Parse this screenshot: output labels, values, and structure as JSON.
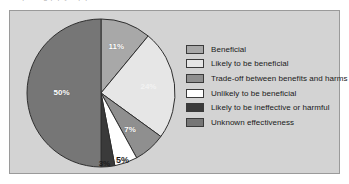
{
  "page": {
    "background": "#ffffff",
    "panel_background": "#d3d3d3",
    "panel_border": "#9a9a9a",
    "top_text_fragment": "a o p  a  o  g  p    p y     a     p      p"
  },
  "chart_data": {
    "type": "pie",
    "title": "",
    "subtitle": "",
    "xlabel": "",
    "ylabel": "",
    "grid": false,
    "legend_position": "right",
    "start_angle_deg": 0,
    "direction": "clockwise",
    "units": "percent",
    "categories": [
      "Beneficial",
      "Likely to be beneficial",
      "Trade-off between benefits and harms",
      "Unlikely to be beneficial",
      "Likely to be ineffective or harmful",
      "Unknown effectiveness"
    ],
    "values": [
      11,
      24,
      7,
      5,
      3,
      50
    ],
    "data_labels": [
      "11%",
      "24%",
      "7%",
      "5%",
      "3%",
      "50%"
    ],
    "colors": [
      "#a8a8a8",
      "#e6e6e6",
      "#8f8f8f",
      "#ffffff",
      "#3a3a3a",
      "#767676"
    ],
    "slice_label_color": [
      "#ffffff",
      "#f2f2f2",
      "#ffffff",
      "#1d1d1d",
      "#1d1d1d",
      "#ffffff"
    ],
    "slice_border_color": "#2e2e2e"
  },
  "legend": {
    "items": [
      {
        "label": "Beneficial",
        "swatch": "#a8a8a8"
      },
      {
        "label": "Likely to be beneficial",
        "swatch": "#e6e6e6"
      },
      {
        "label": "Trade-off between benefits and harms",
        "swatch": "#8f8f8f"
      },
      {
        "label": "Unlikely to be beneficial",
        "swatch": "#ffffff"
      },
      {
        "label": "Likely to be ineffective or harmful",
        "swatch": "#3a3a3a"
      },
      {
        "label": "Unknown effectiveness",
        "swatch": "#767676"
      }
    ]
  }
}
